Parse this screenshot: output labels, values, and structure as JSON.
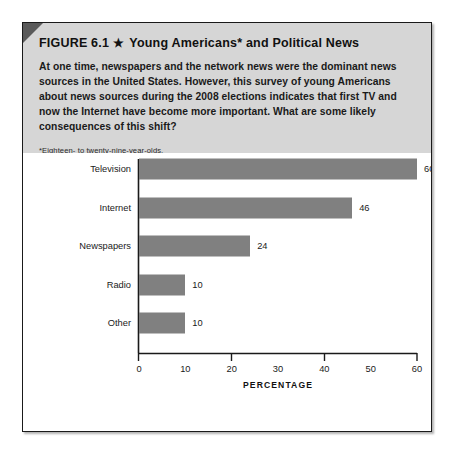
{
  "figure": {
    "title_prefix": "FIGURE 6.1",
    "star": "★",
    "title_main": "Young Americans* and Political News",
    "description": "At one time, newspapers and the network news were the dominant news sources in the United States. However, this survey of young Americans about news sources during the 2008 elections indicates that first TV and now the Internet have become more important. What are some likely consequences of this shift?",
    "footnote": "*Eighteen- to twenty-nine-year-olds.",
    "source": "SOURCE: Pew Internet and American Life Survey, 2008."
  },
  "colors": {
    "bar_fill": "#808080",
    "header_band": "#d6d6d6",
    "border": "#1a1a1a",
    "corner_fold": "#5a5a5a",
    "chart_background": "#ffffff",
    "text": "#1a1a1a"
  },
  "chart_data": {
    "type": "bar",
    "orientation": "horizontal",
    "title": "",
    "xlabel": "PERCENTAGE",
    "ylabel": "",
    "categories": [
      "Television",
      "Internet",
      "Newspapers",
      "Radio",
      "Other"
    ],
    "values": [
      60,
      46,
      24,
      10,
      10
    ],
    "value_labels": [
      "60",
      "46",
      "24",
      "10",
      "10"
    ],
    "xlim": [
      0,
      62
    ],
    "xticks": [
      0,
      10,
      20,
      30,
      40,
      50,
      60
    ],
    "xtick_labels": [
      "0",
      "10",
      "20",
      "30",
      "40",
      "50",
      "60"
    ],
    "major_ticks": [
      0,
      20,
      40,
      60
    ],
    "grid": false,
    "legend": false
  }
}
